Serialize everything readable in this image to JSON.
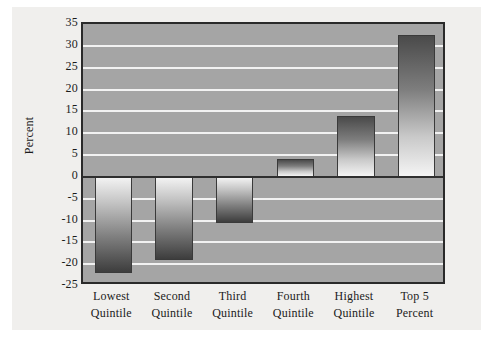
{
  "chart_data": {
    "type": "bar",
    "title": "",
    "xlabel": "",
    "ylabel": "Percent",
    "categories": [
      "Lowest Quintile",
      "Second Quintile",
      "Third Quintile",
      "Fourth Quintile",
      "Highest Quintile",
      "Top 5 Percent"
    ],
    "category_lines": [
      [
        "Lowest",
        "Quintile"
      ],
      [
        "Second",
        "Quintile"
      ],
      [
        "Third",
        "Quintile"
      ],
      [
        "Fourth",
        "Quintile"
      ],
      [
        "Highest",
        "Quintile"
      ],
      [
        "Top 5",
        "Percent"
      ]
    ],
    "values": [
      -22,
      -19,
      -10.5,
      4,
      14,
      32.5
    ],
    "ylim": [
      -25,
      35
    ],
    "ytick_values": [
      35,
      30,
      25,
      20,
      15,
      10,
      5,
      0,
      -5,
      -10,
      -15,
      -20,
      -25
    ],
    "ytick_labels": [
      "35",
      "30",
      "25",
      "20",
      "15",
      "10",
      "5",
      "0",
      "-5",
      "-10",
      "-15",
      "-20",
      "-25"
    ],
    "grid": true,
    "legend": null,
    "series": [
      {
        "name": "Percent change",
        "values": [
          -22,
          -19,
          -10.5,
          4,
          14,
          32.5
        ]
      }
    ]
  },
  "colors": {
    "page_background": "#f0efed",
    "plot_background": "#a5a5a5",
    "gridline": "#f2f2f2",
    "axis_line": "#2a2a2a",
    "zero_line": "#2f2f2f",
    "text": "#1b1b1b",
    "bar_light": "#f4f4f4",
    "bar_dark": "#3d3d3d"
  }
}
